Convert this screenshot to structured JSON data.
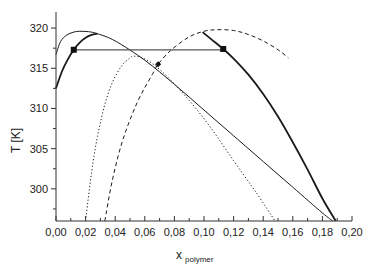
{
  "chart_data": {
    "type": "line",
    "title": "",
    "xlabel": "x",
    "xlabel_subscript": "polymer",
    "ylabel": "T [K]",
    "xlim": [
      0.0,
      0.2
    ],
    "ylim": [
      296,
      322
    ],
    "x_ticks": [
      0.0,
      0.02,
      0.04,
      0.06,
      0.08,
      0.1,
      0.12,
      0.14,
      0.16,
      0.18,
      0.2
    ],
    "x_tick_labels": [
      "0,00",
      "0,02",
      "0,04",
      "0,06",
      "0,08",
      "0,10",
      "0,12",
      "0,14",
      "0,16",
      "0,18",
      "0,20"
    ],
    "x_minor_step": 0.01,
    "y_ticks": [
      300,
      305,
      310,
      315,
      320
    ],
    "y_tick_labels": [
      "300",
      "305",
      "310",
      "315",
      "320"
    ],
    "y_minor_step": 2.5,
    "grid": false,
    "legend": "none",
    "series": [
      {
        "name": "binodal-thin",
        "style": "solid-thin",
        "x": [
          0.0,
          0.003,
          0.007,
          0.012,
          0.016,
          0.022,
          0.028,
          0.04,
          0.06,
          0.08,
          0.1,
          0.12,
          0.14,
          0.16,
          0.18,
          0.187
        ],
        "y": [
          316.7,
          318.3,
          319.1,
          319.5,
          319.6,
          319.55,
          319.3,
          318.4,
          316.0,
          313.0,
          309.8,
          306.6,
          303.4,
          300.2,
          297.0,
          296.0
        ]
      },
      {
        "name": "binodal-thick-left",
        "style": "solid-thick",
        "x": [
          0.0,
          0.004,
          0.008,
          0.012,
          0.016,
          0.02,
          0.024,
          0.028
        ],
        "y": [
          312.5,
          314.6,
          316.1,
          317.3,
          318.2,
          318.8,
          319.15,
          319.3
        ]
      },
      {
        "name": "binodal-thick-right",
        "style": "solid-thick",
        "x": [
          0.099,
          0.105,
          0.113,
          0.12,
          0.13,
          0.14,
          0.15,
          0.16,
          0.17,
          0.18,
          0.189
        ],
        "y": [
          319.5,
          318.6,
          317.4,
          316.2,
          314.2,
          311.8,
          309.0,
          305.8,
          302.4,
          298.8,
          296.0
        ]
      },
      {
        "name": "spinodal-dotted",
        "style": "dotted",
        "x": [
          0.02,
          0.024,
          0.028,
          0.033,
          0.038,
          0.044,
          0.05,
          0.053,
          0.058,
          0.065,
          0.075,
          0.09,
          0.105,
          0.12,
          0.135,
          0.148
        ],
        "y": [
          296.0,
          302.0,
          306.5,
          310.5,
          313.2,
          315.2,
          316.3,
          316.5,
          316.3,
          315.6,
          314.0,
          311.0,
          307.5,
          303.5,
          299.6,
          296.0
        ]
      },
      {
        "name": "spinodal-dashed",
        "style": "dashed",
        "x": [
          0.033,
          0.038,
          0.045,
          0.055,
          0.065,
          0.069,
          0.078,
          0.09,
          0.1,
          0.109,
          0.12,
          0.13,
          0.14,
          0.15,
          0.157
        ],
        "y": [
          296.0,
          301.0,
          306.0,
          310.8,
          314.2,
          315.5,
          317.3,
          318.9,
          319.6,
          319.8,
          319.7,
          319.2,
          318.4,
          317.3,
          316.3
        ]
      },
      {
        "name": "tie-line",
        "style": "solid-gray",
        "x": [
          0.012,
          0.113
        ],
        "y": [
          317.3,
          317.3
        ]
      }
    ],
    "markers": [
      {
        "name": "coexistence-left",
        "shape": "square",
        "x": 0.012,
        "y": 317.3
      },
      {
        "name": "coexistence-right",
        "shape": "square",
        "x": 0.113,
        "y": 317.4
      },
      {
        "name": "critical-point",
        "shape": "diamond",
        "x": 0.069,
        "y": 315.5
      }
    ],
    "colors": {
      "line": "#1a1a1a",
      "tie_line": "#555555",
      "axis": "#333333"
    }
  }
}
